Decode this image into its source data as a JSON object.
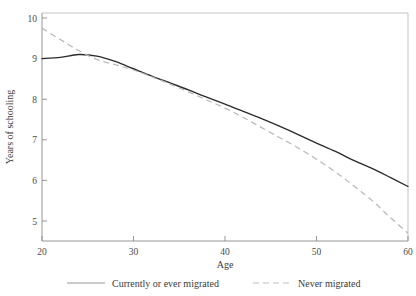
{
  "chart_data": {
    "type": "line",
    "title": "",
    "xlabel": "Age",
    "ylabel": "Years of schooling",
    "xlim": [
      19,
      61
    ],
    "ylim": [
      4.5,
      10.1
    ],
    "grid": false,
    "legend_position": "bottom",
    "x_ticks": [
      20,
      30,
      40,
      50,
      60
    ],
    "y_ticks": [
      5,
      6,
      7,
      8,
      9,
      10
    ],
    "x": [
      20,
      22,
      24,
      26,
      28,
      30,
      32,
      34,
      36,
      38,
      40,
      42,
      44,
      46,
      48,
      50,
      52,
      54,
      56,
      58,
      60
    ],
    "series": [
      {
        "name": "Currently or ever migrated",
        "style": "solid",
        "color": "#2b2b2b",
        "values": [
          9.0,
          9.03,
          9.1,
          9.06,
          8.93,
          8.75,
          8.57,
          8.4,
          8.23,
          8.05,
          7.88,
          7.7,
          7.52,
          7.33,
          7.13,
          6.92,
          6.72,
          6.5,
          6.3,
          6.08,
          5.85
        ]
      },
      {
        "name": "Never migrated",
        "style": "dashed",
        "color": "#b9b9b9",
        "values": [
          9.75,
          9.47,
          9.2,
          8.98,
          8.85,
          8.72,
          8.55,
          8.37,
          8.18,
          7.98,
          7.78,
          7.55,
          7.3,
          7.05,
          6.8,
          6.52,
          6.22,
          5.88,
          5.52,
          5.1,
          4.7
        ]
      }
    ]
  },
  "legend": {
    "items": [
      {
        "label": "Currently or ever migrated",
        "style": "solid"
      },
      {
        "label": "Never migrated",
        "style": "dashed"
      }
    ]
  },
  "axes": {
    "x_tick_labels": [
      "20",
      "30",
      "40",
      "50",
      "60"
    ],
    "y_tick_labels": [
      "10",
      "9",
      "8",
      "7",
      "6",
      "5"
    ],
    "x_axis_title": "Age",
    "y_axis_title": "Years of schooling"
  }
}
